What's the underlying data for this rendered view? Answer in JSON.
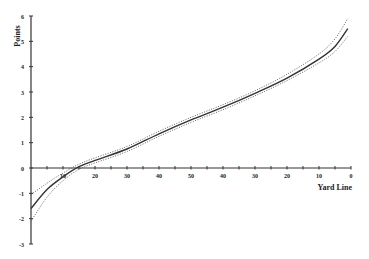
{
  "chart_data": {
    "type": "line",
    "title": "",
    "xlabel": "Yard Line",
    "ylabel": "Points",
    "x_tick_labels": [
      "10",
      "20",
      "30",
      "40",
      "50",
      "40",
      "30",
      "20",
      "10",
      "0"
    ],
    "y_tick_labels": [
      "-3",
      "-2",
      "-1",
      "0",
      "1",
      "2",
      "3",
      "4",
      "5",
      "6"
    ],
    "ylim": [
      -3,
      6
    ],
    "xlim": [
      0,
      100
    ],
    "grid": false,
    "legend": null,
    "x_note": "x measured as yards from own goal line (0-100); labels run 10..50..10, 0",
    "series": [
      {
        "name": "Expected points",
        "style": "solid",
        "x": [
          0,
          5,
          10,
          15,
          20,
          30,
          40,
          50,
          60,
          70,
          80,
          90,
          95,
          99
        ],
        "y": [
          -1.6,
          -0.85,
          -0.35,
          0.05,
          0.3,
          0.75,
          1.35,
          1.9,
          2.4,
          2.95,
          3.55,
          4.3,
          4.8,
          5.5
        ]
      },
      {
        "name": "Upper band",
        "style": "dotted",
        "x": [
          0,
          5,
          10,
          15,
          20,
          30,
          40,
          50,
          60,
          70,
          80,
          90,
          95,
          99
        ],
        "y": [
          -1.05,
          -0.6,
          -0.2,
          0.15,
          0.4,
          0.85,
          1.45,
          2.0,
          2.5,
          3.05,
          3.7,
          4.5,
          5.1,
          5.9
        ]
      },
      {
        "name": "Lower band",
        "style": "dotted",
        "x": [
          0,
          5,
          10,
          15,
          20,
          30,
          40,
          50,
          60,
          70,
          80,
          90,
          95,
          99
        ],
        "y": [
          -2.1,
          -1.15,
          -0.5,
          -0.05,
          0.2,
          0.65,
          1.25,
          1.8,
          2.3,
          2.85,
          3.45,
          4.15,
          4.6,
          5.2
        ]
      }
    ]
  }
}
